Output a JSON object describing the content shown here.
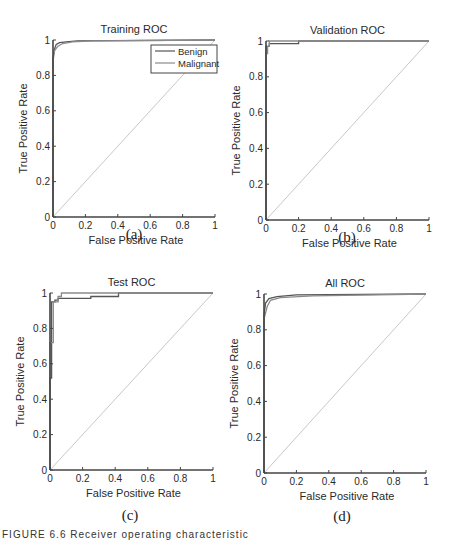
{
  "chart_data": [
    {
      "type": "line",
      "id": "a",
      "title": "Training ROC",
      "xlabel": "False Positive Rate",
      "ylabel": "True Positive Rate",
      "xlim": [
        0,
        1
      ],
      "ylim": [
        0,
        1
      ],
      "xticks": [
        "0",
        "0.2",
        "0.4",
        "0.6",
        "0.8",
        "1"
      ],
      "yticks": [
        "0",
        "0.2",
        "0.4",
        "0.6",
        "0.8",
        "1"
      ],
      "grid": false,
      "legend": {
        "position": "upper right",
        "entries": [
          "Benign",
          "Malignant"
        ]
      },
      "series": [
        {
          "name": "Benign",
          "color": "#555555",
          "x": [
            0,
            0,
            0.01,
            0.02,
            0.04,
            0.08,
            0.15,
            1
          ],
          "y": [
            0,
            0.9,
            0.95,
            0.975,
            0.985,
            0.99,
            0.995,
            1
          ]
        },
        {
          "name": "Malignant",
          "color": "#8a8a8a",
          "x": [
            0,
            0,
            0.01,
            0.03,
            0.06,
            0.12,
            0.25,
            1
          ],
          "y": [
            0,
            0.88,
            0.94,
            0.965,
            0.98,
            0.99,
            0.995,
            1
          ]
        },
        {
          "name": "Chance",
          "color": "#c8c8c8",
          "x": [
            0,
            1
          ],
          "y": [
            0,
            1
          ]
        }
      ],
      "sub_label": "(a)"
    },
    {
      "type": "line",
      "id": "b",
      "title": "Validation ROC",
      "xlabel": "False Positive Rate",
      "ylabel": "True Positive Rate",
      "xlim": [
        0,
        1
      ],
      "ylim": [
        0,
        1
      ],
      "xticks": [
        "0",
        "0.2",
        "0.4",
        "0.6",
        "0.8",
        "1"
      ],
      "yticks": [
        "0",
        "0.2",
        "0.4",
        "0.6",
        "0.8",
        "1"
      ],
      "grid": false,
      "series": [
        {
          "name": "Benign",
          "color": "#555555",
          "x": [
            0,
            0,
            0.02,
            0.02,
            0.2,
            0.2,
            1
          ],
          "y": [
            0,
            0.97,
            0.97,
            0.985,
            0.985,
            1,
            1
          ]
        },
        {
          "name": "Malignant",
          "color": "#8a8a8a",
          "x": [
            0,
            0,
            0.01,
            0.01,
            0.02,
            0.02,
            1
          ],
          "y": [
            0,
            0.93,
            0.93,
            0.97,
            0.97,
            1,
            1
          ]
        },
        {
          "name": "Chance",
          "color": "#c8c8c8",
          "x": [
            0,
            1
          ],
          "y": [
            0,
            1
          ]
        }
      ],
      "sub_label": "(b)"
    },
    {
      "type": "line",
      "id": "c",
      "title": "Test ROC",
      "xlabel": "False Positive Rate",
      "ylabel": "True Positive Rate",
      "xlim": [
        0,
        1
      ],
      "ylim": [
        0,
        1
      ],
      "xticks": [
        "0",
        "0.2",
        "0.4",
        "0.6",
        "0.8",
        "1"
      ],
      "yticks": [
        "0",
        "0.2",
        "0.4",
        "0.6",
        "0.8",
        "1"
      ],
      "grid": false,
      "series": [
        {
          "name": "Benign",
          "color": "#555555",
          "x": [
            0,
            0,
            0.01,
            0.01,
            0.03,
            0.03,
            0.05,
            0.05,
            0.25,
            0.25,
            0.42,
            0.42,
            1
          ],
          "y": [
            0,
            0.52,
            0.52,
            0.95,
            0.95,
            0.96,
            0.96,
            0.97,
            0.97,
            0.98,
            0.98,
            1,
            1
          ]
        },
        {
          "name": "Malignant",
          "color": "#8a8a8a",
          "x": [
            0,
            0,
            0.02,
            0.02,
            0.05,
            0.05,
            0.07,
            0.07,
            1
          ],
          "y": [
            0,
            0.72,
            0.72,
            0.95,
            0.95,
            0.98,
            0.98,
            1,
            1
          ]
        },
        {
          "name": "Chance",
          "color": "#c8c8c8",
          "x": [
            0,
            1
          ],
          "y": [
            0,
            1
          ]
        }
      ],
      "sub_label": "(c)"
    },
    {
      "type": "line",
      "id": "d",
      "title": "All ROC",
      "xlabel": "False Positive Rate",
      "ylabel": "True Positive Rate",
      "xlim": [
        0,
        1
      ],
      "ylim": [
        0,
        1
      ],
      "xticks": [
        "0",
        "0.2",
        "0.4",
        "0.6",
        "0.8",
        "1"
      ],
      "yticks": [
        "0",
        "0.2",
        "0.4",
        "0.6",
        "0.8",
        "1"
      ],
      "grid": false,
      "series": [
        {
          "name": "Benign",
          "color": "#555555",
          "x": [
            0,
            0,
            0.01,
            0.03,
            0.08,
            0.2,
            1
          ],
          "y": [
            0,
            0.88,
            0.95,
            0.975,
            0.985,
            0.995,
            1
          ]
        },
        {
          "name": "Malignant",
          "color": "#8a8a8a",
          "x": [
            0,
            0,
            0.02,
            0.04,
            0.1,
            0.3,
            1
          ],
          "y": [
            0,
            0.86,
            0.93,
            0.965,
            0.98,
            0.99,
            1
          ]
        },
        {
          "name": "Chance",
          "color": "#c8c8c8",
          "x": [
            0,
            1
          ],
          "y": [
            0,
            1
          ]
        }
      ],
      "sub_label": "(d)"
    }
  ],
  "caption": "FIGURE 6.6   Receiver operating characteristic"
}
